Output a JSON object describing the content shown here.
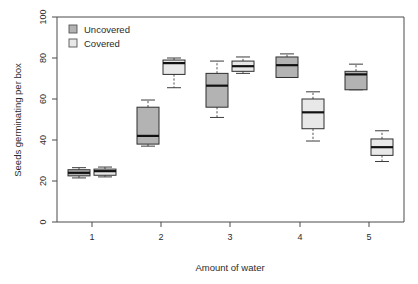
{
  "chart_data": {
    "type": "box",
    "title": "",
    "xlabel": "Amount of water",
    "ylabel": "Seeds germinating per box",
    "categories": [
      "1",
      "2",
      "3",
      "4",
      "5"
    ],
    "xticklabels": [
      "1",
      "2",
      "3",
      "4",
      "5"
    ],
    "yticklabels": [
      "0",
      "20",
      "40",
      "60",
      "80",
      "100"
    ],
    "yticks": [
      0,
      20,
      40,
      60,
      80,
      100
    ],
    "ylim": [
      0,
      100
    ],
    "grid": false,
    "legend_position": "top-left",
    "legend": [
      "Uncovered",
      "Covered"
    ],
    "colors": {
      "uncovered": "#b3b3b3",
      "covered": "#e8e8e8",
      "outline": "#2e2e2e",
      "median": "#111111",
      "axis": "#4a4a4a"
    },
    "series": [
      {
        "name": "Uncovered",
        "fill": "#b3b3b3",
        "boxes": [
          {
            "category": "1",
            "min": 21.5,
            "q1": 22.5,
            "median": 24.0,
            "q3": 25.5,
            "max": 26.5
          },
          {
            "category": "2",
            "min": 37.0,
            "q1": 38.0,
            "median": 42.0,
            "q3": 56.0,
            "max": 59.5
          },
          {
            "category": "3",
            "min": 51.0,
            "q1": 56.0,
            "median": 66.5,
            "q3": 72.5,
            "max": 78.5
          },
          {
            "category": "4",
            "min": 74.0,
            "q1": 70.5,
            "median": 76.5,
            "q3": 80.5,
            "max": 82.0
          },
          {
            "category": "5",
            "min": 68.5,
            "q1": 64.5,
            "median": 72.0,
            "q3": 73.5,
            "max": 77.0
          }
        ]
      },
      {
        "name": "Covered",
        "fill": "#e8e8e8",
        "boxes": [
          {
            "category": "1",
            "min": 22.0,
            "q1": 22.8,
            "median": 24.8,
            "q3": 25.8,
            "max": 26.8
          },
          {
            "category": "2",
            "min": 65.5,
            "q1": 72.0,
            "median": 77.5,
            "q3": 79.0,
            "max": 80.0
          },
          {
            "category": "3",
            "min": 72.5,
            "q1": 73.5,
            "median": 76.0,
            "q3": 78.5,
            "max": 80.5
          },
          {
            "category": "4",
            "min": 39.5,
            "q1": 45.5,
            "median": 53.5,
            "q3": 60.0,
            "max": 63.5
          },
          {
            "category": "5",
            "min": 29.5,
            "q1": 32.5,
            "median": 36.5,
            "q3": 40.5,
            "max": 44.5
          }
        ]
      }
    ]
  },
  "axis": {
    "y_title": "Seeds germinating per box",
    "x_title": "Amount of water",
    "y_tick_0": "0",
    "y_tick_20": "20",
    "y_tick_40": "40",
    "y_tick_60": "60",
    "y_tick_80": "80",
    "y_tick_100": "100",
    "x_tick_1": "1",
    "x_tick_2": "2",
    "x_tick_3": "3",
    "x_tick_4": "4",
    "x_tick_5": "5"
  },
  "legend": {
    "item_uncovered": "Uncovered",
    "item_covered": "Covered"
  }
}
